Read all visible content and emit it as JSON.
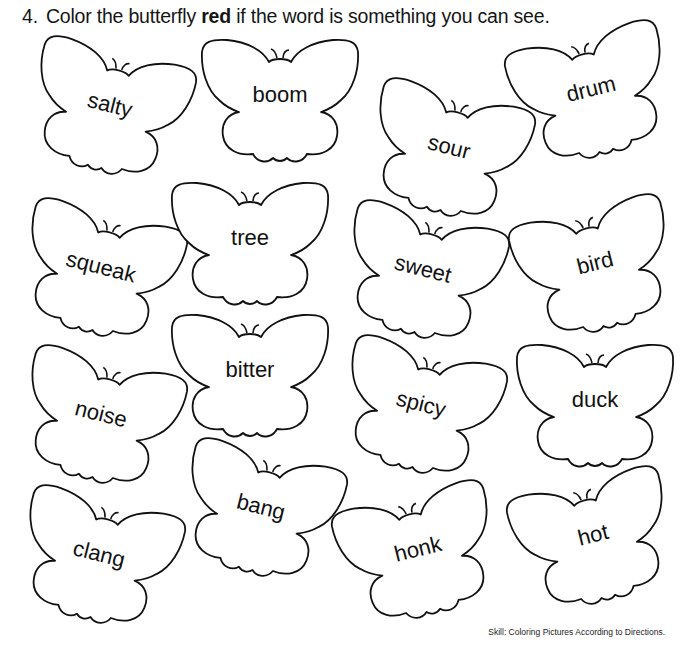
{
  "instruction": {
    "number": "4.",
    "before": "Color the butterfly",
    "emphasis": "red",
    "after": "if the word is something you can see."
  },
  "butterflies": [
    {
      "word": "salty",
      "x": 25,
      "y": 48,
      "rot": 14
    },
    {
      "word": "boom",
      "x": 197,
      "y": 38,
      "rot": 0
    },
    {
      "word": "sour",
      "x": 364,
      "y": 90,
      "rot": 14
    },
    {
      "word": "drum",
      "x": 510,
      "y": 32,
      "rot": -14
    },
    {
      "word": "squeak",
      "x": 16,
      "y": 210,
      "rot": 14
    },
    {
      "word": "tree",
      "x": 167,
      "y": 181,
      "rot": 0
    },
    {
      "word": "sweet",
      "x": 338,
      "y": 212,
      "rot": 14
    },
    {
      "word": "bird",
      "x": 514,
      "y": 206,
      "rot": -14
    },
    {
      "word": "noise",
      "x": 16,
      "y": 357,
      "rot": 14
    },
    {
      "word": "bitter",
      "x": 167,
      "y": 313,
      "rot": 0
    },
    {
      "word": "spicy",
      "x": 336,
      "y": 347,
      "rot": 14
    },
    {
      "word": "duck",
      "x": 512,
      "y": 343,
      "rot": 0
    },
    {
      "word": "clang",
      "x": 14,
      "y": 497,
      "rot": 14
    },
    {
      "word": "bang",
      "x": 176,
      "y": 450,
      "rot": 14
    },
    {
      "word": "honk",
      "x": 337,
      "y": 492,
      "rot": -14
    },
    {
      "word": "hot",
      "x": 512,
      "y": 478,
      "rot": -14
    }
  ],
  "footer": "Skill: Coloring Pictures According to Directions.",
  "colors": {
    "ink": "#111111",
    "paper": "#ffffff"
  }
}
